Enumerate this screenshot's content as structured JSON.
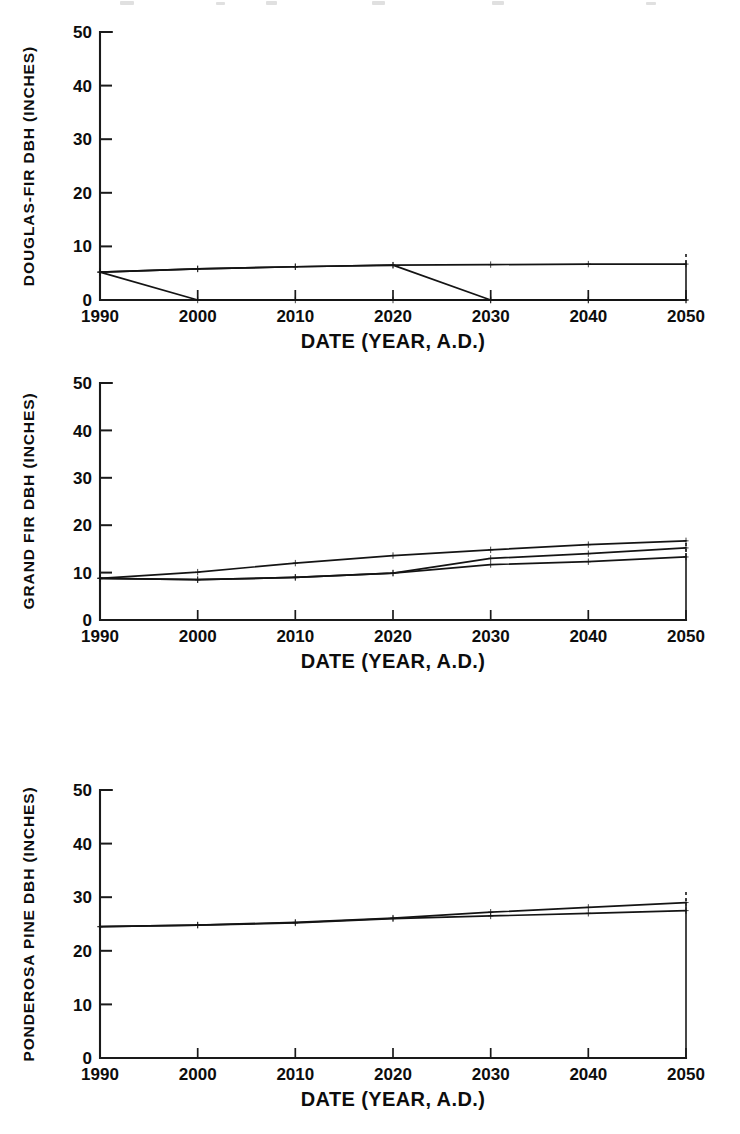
{
  "figure": {
    "background_color": "#ffffff",
    "ink_color": "#141414",
    "panel_count": 3,
    "shared_xlabel": "DATE (YEAR, A.D.)",
    "shared_x_ticks": [
      "1990",
      "2000",
      "2010",
      "2020",
      "2030",
      "2040",
      "2050"
    ],
    "shared_y_ticks": [
      "0",
      "10",
      "20",
      "30",
      "40",
      "50"
    ]
  },
  "chart_data": [
    {
      "type": "line",
      "title": "",
      "panel_index": 0,
      "ylabel": "DOUGLAS-FIR DBH (INCHES)",
      "xlabel": "DATE (YEAR, A.D.)",
      "x": [
        1990,
        2000,
        2010,
        2020,
        2030,
        2040,
        2050
      ],
      "xtick_labels": [
        "1990",
        "2000",
        "2010",
        "2020",
        "2030",
        "2040",
        "2050"
      ],
      "ytick_labels": [
        "0",
        "10",
        "20",
        "30",
        "40",
        "50"
      ],
      "xlim": [
        1990,
        2050
      ],
      "ylim": [
        0,
        50
      ],
      "grid": false,
      "legend": "none",
      "markers": "plus",
      "series": [
        {
          "name": "no-harvest",
          "values": [
            5.2,
            5.8,
            6.2,
            6.5,
            6.6,
            6.7,
            6.7
          ]
        },
        {
          "name": "harvest-2000",
          "values": [
            5.2,
            0.0,
            0.0,
            0.0,
            0.0,
            0.0,
            0.0
          ]
        },
        {
          "name": "harvest-2030",
          "values": [
            5.2,
            5.8,
            6.2,
            6.5,
            0.0,
            0.0,
            0.0
          ]
        }
      ]
    },
    {
      "type": "line",
      "title": "",
      "panel_index": 1,
      "ylabel": "GRAND FIR DBH (INCHES)",
      "xlabel": "DATE (YEAR, A.D.)",
      "x": [
        1990,
        2000,
        2010,
        2020,
        2030,
        2040,
        2050
      ],
      "xtick_labels": [
        "1990",
        "2000",
        "2010",
        "2020",
        "2030",
        "2040",
        "2050"
      ],
      "ytick_labels": [
        "0",
        "10",
        "20",
        "30",
        "40",
        "50"
      ],
      "xlim": [
        1990,
        2050
      ],
      "ylim": [
        0,
        50
      ],
      "grid": false,
      "legend": "none",
      "markers": "plus",
      "series": [
        {
          "name": "upper",
          "values": [
            8.8,
            10.1,
            12.0,
            13.6,
            14.8,
            15.9,
            16.7
          ]
        },
        {
          "name": "middle",
          "values": [
            8.8,
            8.5,
            9.0,
            9.9,
            13.0,
            14.0,
            15.2
          ]
        },
        {
          "name": "lower",
          "values": [
            8.8,
            8.5,
            9.0,
            9.9,
            11.7,
            12.3,
            13.3
          ]
        }
      ]
    },
    {
      "type": "line",
      "title": "",
      "panel_index": 2,
      "ylabel": "PONDEROSA PINE DBH (INCHES)",
      "xlabel": "DATE (YEAR, A.D.)",
      "x": [
        1990,
        2000,
        2010,
        2020,
        2030,
        2040,
        2050
      ],
      "xtick_labels": [
        "1990",
        "2000",
        "2010",
        "2020",
        "2030",
        "2040",
        "2050"
      ],
      "ytick_labels": [
        "0",
        "10",
        "20",
        "30",
        "40",
        "50"
      ],
      "xlim": [
        1990,
        2050
      ],
      "ylim": [
        0,
        50
      ],
      "grid": false,
      "legend": "none",
      "markers": "plus",
      "series": [
        {
          "name": "upper",
          "values": [
            24.5,
            24.8,
            25.3,
            26.1,
            27.2,
            28.1,
            29.0
          ]
        },
        {
          "name": "lower",
          "values": [
            24.5,
            24.8,
            25.2,
            26.0,
            26.5,
            27.0,
            27.5
          ]
        }
      ]
    }
  ]
}
